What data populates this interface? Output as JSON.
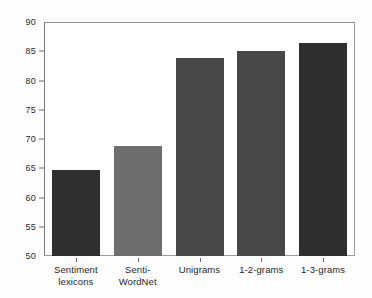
{
  "chart_data": {
    "type": "bar",
    "title": "",
    "xlabel": "",
    "ylabel": "",
    "ylim": [
      50,
      90
    ],
    "ytick_step": 5,
    "yticks": [
      50,
      55,
      60,
      65,
      70,
      75,
      80,
      85,
      90
    ],
    "ytick_labels": [
      "50",
      "55",
      "60",
      "65",
      "70",
      "75",
      "80",
      "85",
      "90"
    ],
    "grid": false,
    "legend": null,
    "categories": [
      "Sentiment\nlexicons",
      "Senti-\nWordNet",
      "Unigrams",
      "1-2-grams",
      "1-3-grams"
    ],
    "values": [
      64.7,
      68.8,
      83.8,
      85.1,
      86.4
    ],
    "bar_colors": [
      "#2f2f2f",
      "#6e6e6e",
      "#484848",
      "#484848",
      "#2e2e2e"
    ],
    "background_color": "#fdfdfd",
    "plot_background_color": "#ffffff",
    "frame_color": "#9a9a9a"
  }
}
